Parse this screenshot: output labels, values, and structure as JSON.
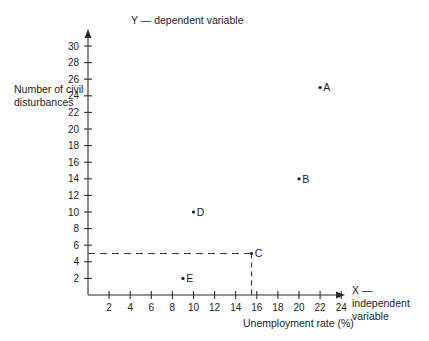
{
  "chart_data": {
    "type": "scatter",
    "title": "",
    "xlabel": "Unemployment rate (%)",
    "ylabel": "Number of civil disturbances",
    "x_axis_caption": "X — independent variable",
    "y_axis_caption": "Y — dependent variable",
    "xlim": [
      0,
      26
    ],
    "ylim": [
      0,
      31
    ],
    "xticks": [
      2,
      4,
      6,
      8,
      10,
      12,
      14,
      16,
      18,
      20,
      22,
      24
    ],
    "yticks": [
      2,
      4,
      6,
      8,
      10,
      12,
      14,
      16,
      18,
      20,
      22,
      24,
      26,
      28,
      30
    ],
    "grid": false,
    "legend": "none",
    "points": [
      {
        "label": "A",
        "x": 22.0,
        "y": 25.0
      },
      {
        "label": "B",
        "x": 20.0,
        "y": 14.0
      },
      {
        "label": "C",
        "x": 15.5,
        "y": 5.0
      },
      {
        "label": "D",
        "x": 10.0,
        "y": 10.0
      },
      {
        "label": "E",
        "x": 9.0,
        "y": 2.0
      }
    ],
    "annotations": [
      {
        "name": "horizontal-guide",
        "type": "dashed-line",
        "orientation": "horizontal",
        "from": [
          0,
          5.0
        ],
        "to": [
          15.5,
          5.0
        ]
      },
      {
        "name": "vertical-guide",
        "type": "dashed-line",
        "orientation": "vertical",
        "from": [
          15.5,
          5.0
        ],
        "to": [
          15.5,
          0
        ]
      }
    ],
    "colors": {
      "axis": "#2b2b2b",
      "point": "#1c1c1c",
      "guide": "#3a3a3a",
      "background": "#ffffff"
    }
  },
  "figure": {
    "top_edge_artifact": ""
  }
}
